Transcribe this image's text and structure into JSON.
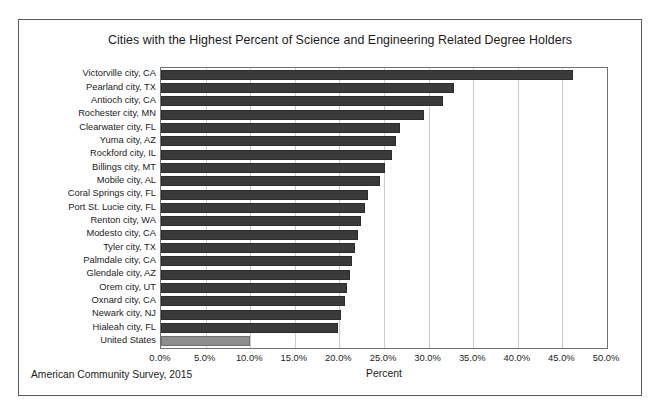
{
  "chart_data": {
    "type": "bar",
    "orientation": "horizontal",
    "title": "Cities with the Highest Percent of Science and Engineering Related Degree Holders",
    "xlabel": "Percent",
    "ylabel": "",
    "xlim": [
      0,
      50
    ],
    "xtick_labels": [
      "0.0%",
      "5.0%",
      "10.0%",
      "15.0%",
      "20.0%",
      "25.0%",
      "30.0%",
      "35.0%",
      "40.0%",
      "45.0%",
      "50.0%"
    ],
    "xtick_values": [
      0,
      5,
      10,
      15,
      20,
      25,
      30,
      35,
      40,
      45,
      50
    ],
    "grid": "vertical",
    "legend": "none",
    "source_note": "American Community Survey, 2015",
    "categories": [
      "Victorville city, CA",
      "Pearland city, TX",
      "Antioch city, CA",
      "Rochester city, MN",
      "Clearwater city, FL",
      "Yuma city, AZ",
      "Rockford city, IL",
      "Billings city, MT",
      "Mobile city, AL",
      "Coral Springs city, FL",
      "Port St. Lucie city, FL",
      "Renton city, WA",
      "Modesto city, CA",
      "Tyler city, TX",
      "Palmdale city, CA",
      "Glendale city, AZ",
      "Orem city, UT",
      "Oxnard city, CA",
      "Newark city, NJ",
      "Hialeah city, FL",
      "United States"
    ],
    "values": [
      46.2,
      32.9,
      31.6,
      29.5,
      26.8,
      26.4,
      25.9,
      25.1,
      24.6,
      23.2,
      22.9,
      22.4,
      22.1,
      21.8,
      21.4,
      21.2,
      20.9,
      20.6,
      20.2,
      19.8,
      10.0
    ],
    "series": [
      {
        "name": "Percent of Science and Engineering Related Degree Holders",
        "color": "#3a3a3a",
        "highlight_color": "#8e8e8e",
        "highlight_category": "United States"
      }
    ]
  }
}
